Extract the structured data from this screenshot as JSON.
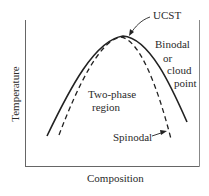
{
  "diagram": {
    "type": "phase-diagram",
    "x_axis_label": "Composition",
    "y_axis_label": "Temperature",
    "annotations": {
      "ucst": "UCST",
      "binodal_line1": "Binodal",
      "binodal_line2": "or",
      "binodal_line3": "cloud",
      "binodal_line4": "point",
      "region_line1": "Two-phase",
      "region_line2": "region",
      "spinodal": "Spinodal"
    },
    "curves": [
      {
        "name": "Binodal or cloud point",
        "style": "solid"
      },
      {
        "name": "Spinodal",
        "style": "dashed"
      }
    ],
    "colors": {
      "line": "#222222",
      "axis": "#555555",
      "background": "#ffffff"
    }
  }
}
